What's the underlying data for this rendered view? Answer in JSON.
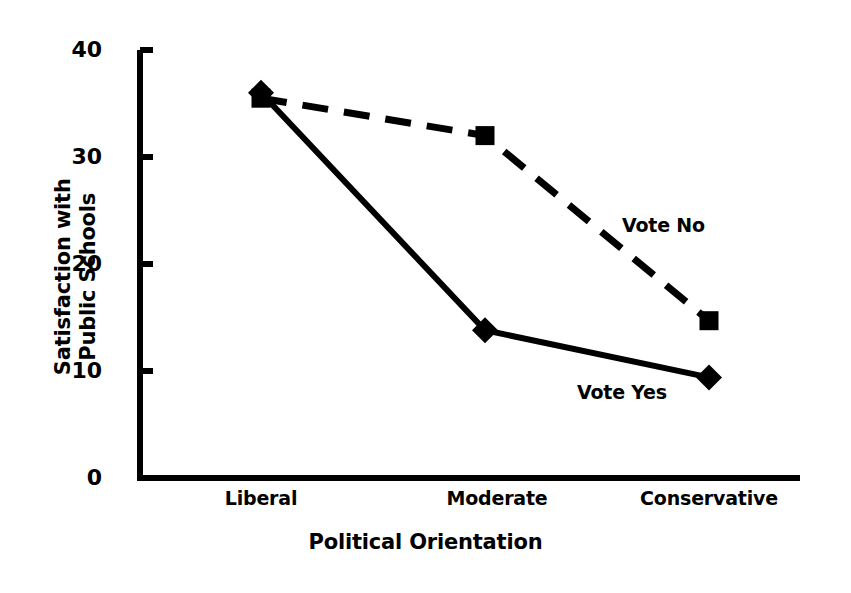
{
  "chart_data": {
    "type": "line",
    "title": "",
    "xlabel": "Political Orientation",
    "ylabel": "Satisfaction with\nPublic Schools",
    "categories": [
      "Liberal",
      "Moderate",
      "Conservative"
    ],
    "ylim": [
      0,
      40
    ],
    "yticks": [
      0,
      10,
      20,
      30,
      40
    ],
    "ytick_labels": [
      "0",
      "10",
      "20",
      "30",
      "40"
    ],
    "grid": false,
    "legend_position": "inline-annotation",
    "series": [
      {
        "name": "Vote No",
        "values": [
          35.5,
          32.0,
          14.7
        ],
        "marker": "square",
        "linestyle": "dashed",
        "color": "#000000",
        "label_text": "Vote No"
      },
      {
        "name": "Vote Yes",
        "values": [
          36.0,
          13.8,
          9.4
        ],
        "marker": "diamond",
        "linestyle": "solid",
        "color": "#000000",
        "label_text": "Vote Yes"
      }
    ]
  },
  "axes": {
    "y_title": "Satisfaction with\nPublic Schools",
    "x_title": "Political Orientation",
    "y_tick_labels": [
      "40",
      "30",
      "20",
      "10",
      "0"
    ],
    "x_tick_labels": [
      "Liberal",
      "Moderate",
      "Conservative"
    ]
  },
  "colors": {
    "ink": "#000000",
    "background": "#ffffff"
  }
}
